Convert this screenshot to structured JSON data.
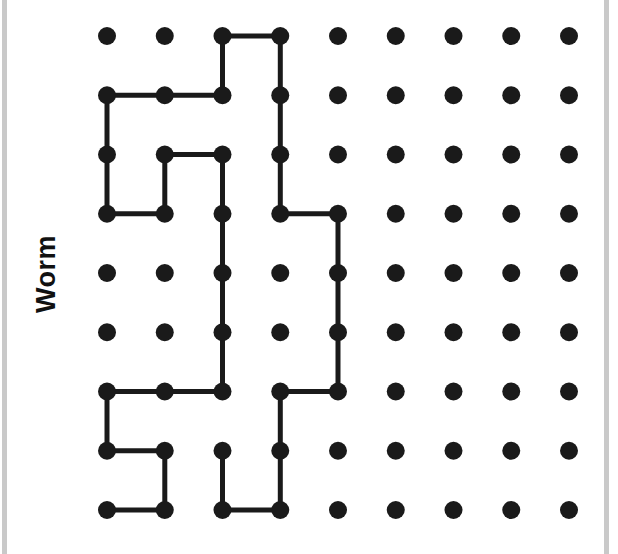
{
  "diagram": {
    "label": "Worm",
    "colors": {
      "ink": "#1a1a1a",
      "border": "#c9c9c9",
      "background": "#ffffff"
    },
    "grid": {
      "columns": 9,
      "rows": 9,
      "origin_x": 107,
      "origin_y": 36,
      "spacing_x": 57.75,
      "spacing_y": 59.25,
      "dot_radius": 9,
      "line_width": 5
    },
    "worm_path": [
      [
        0,
        8
      ],
      [
        1,
        8
      ],
      [
        1,
        7
      ],
      [
        0,
        7
      ],
      [
        0,
        6
      ],
      [
        1,
        6
      ],
      [
        2,
        6
      ],
      [
        2,
        5
      ],
      [
        2,
        4
      ],
      [
        2,
        3
      ],
      [
        2,
        2
      ],
      [
        1,
        2
      ],
      [
        1,
        3
      ],
      [
        0,
        3
      ],
      [
        0,
        2
      ],
      [
        0,
        1
      ],
      [
        1,
        1
      ],
      [
        2,
        1
      ],
      [
        2,
        0
      ],
      [
        3,
        0
      ],
      [
        3,
        1
      ],
      [
        3,
        2
      ],
      [
        3,
        3
      ],
      [
        4,
        3
      ],
      [
        4,
        4
      ],
      [
        4,
        5
      ],
      [
        4,
        6
      ],
      [
        3,
        6
      ],
      [
        3,
        7
      ],
      [
        3,
        8
      ],
      [
        2,
        8
      ],
      [
        2,
        7
      ]
    ]
  }
}
